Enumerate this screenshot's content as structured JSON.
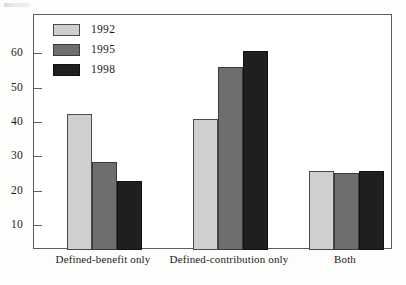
{
  "chart_data": {
    "type": "bar",
    "title": "",
    "subtitle": "",
    "xlabel": "",
    "ylabel": "",
    "categories": [
      "Defined-benefit only",
      "Defined-contribution only",
      "Both"
    ],
    "series": [
      {
        "name": "1992",
        "color": "#cfcfcf",
        "values": [
          39.5,
          38,
          23
        ]
      },
      {
        "name": "1995",
        "color": "#6e6e6e",
        "values": [
          25.5,
          53,
          22.3
        ]
      },
      {
        "name": "1998",
        "color": "#1f1f1f",
        "values": [
          20,
          57.5,
          23
        ]
      }
    ],
    "ylim": [
      0,
      68
    ],
    "yticks": [
      10,
      20,
      30,
      40,
      50,
      60
    ],
    "ytick_labels": [
      "10",
      "20",
      "30",
      "40",
      "50",
      "60"
    ],
    "grid": false,
    "legend_position": "top-left",
    "annotations": []
  },
  "legend": {
    "entries": [
      {
        "label": "1992",
        "swatch": "legend-swatch-1992"
      },
      {
        "label": "1995",
        "swatch": "legend-swatch-1995"
      },
      {
        "label": "1998",
        "swatch": "legend-swatch-1998"
      }
    ]
  },
  "axis": {
    "y_tick_labels": [
      "60",
      "50",
      "40",
      "30",
      "20",
      "10"
    ],
    "x_category_labels": [
      "Defined-benefit only",
      "Defined-contribution only",
      "Both"
    ]
  }
}
